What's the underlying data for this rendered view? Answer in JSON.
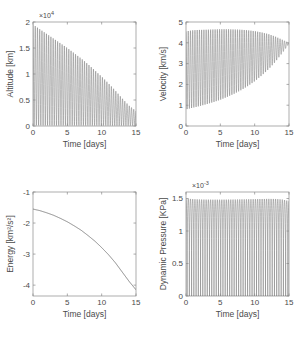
{
  "figure": {
    "background": "#ffffff",
    "axis_color": "#8a8a8a",
    "trace_color": "#6b6b6b",
    "text_color": "#4a4a4a",
    "layout": "2x2 subplot grid"
  },
  "chart_data": [
    {
      "type": "line",
      "name": "altitude-vs-time",
      "title": "",
      "xlabel": "Time [days]",
      "ylabel": "Altitude [km]",
      "y_exponent_label": "×10",
      "y_exponent_value": "4",
      "xlim": [
        0,
        15
      ],
      "ylim": [
        0,
        20000
      ],
      "xticks": [
        0,
        5,
        10,
        15
      ],
      "xticklabels": [
        "0",
        "5",
        "10",
        "15"
      ],
      "yticks": [
        0,
        5000,
        10000,
        15000,
        20000
      ],
      "yticklabels": [
        "0",
        "0.5",
        "1",
        "1.5",
        "2"
      ],
      "grid": false,
      "description": "Rapid periodic oscillations (orbital apoapsis/periapsis) whose upper envelope decays nearly linearly while the lower envelope stays near zero.",
      "oscillation": {
        "cycles": 46,
        "upper_envelope_x": [
          0,
          1,
          2,
          3,
          4,
          5,
          6,
          7,
          8,
          9,
          10,
          11,
          12,
          13,
          14,
          15
        ],
        "upper_envelope_y": [
          19500,
          18600,
          17700,
          16800,
          15900,
          15000,
          14000,
          13000,
          11900,
          10700,
          9500,
          8200,
          6800,
          5300,
          3900,
          2900
        ],
        "lower_envelope_x": [
          0,
          5,
          10,
          15
        ],
        "lower_envelope_y": [
          120,
          110,
          100,
          90
        ]
      }
    },
    {
      "type": "line",
      "name": "velocity-vs-time",
      "title": "",
      "xlabel": "Time [days]",
      "ylabel": "Velocity [km/s]",
      "xlim": [
        0,
        15
      ],
      "ylim": [
        0,
        5
      ],
      "xticks": [
        0,
        5,
        10,
        15
      ],
      "xticklabels": [
        "0",
        "5",
        "10",
        "15"
      ],
      "yticks": [
        0,
        1,
        2,
        3,
        4,
        5
      ],
      "yticklabels": [
        "0",
        "1",
        "2",
        "3",
        "4",
        "5"
      ],
      "grid": false,
      "description": "Periodic velocity oscillations between periapsis maxima near 4.6 km/s and apoapsis minima rising from 0.8 km/s, converging to about 4 km/s at the end.",
      "oscillation": {
        "cycles": 46,
        "upper_envelope_x": [
          0,
          1,
          2,
          3,
          4,
          5,
          6,
          7,
          8,
          9,
          10,
          11,
          12,
          13,
          14,
          15
        ],
        "upper_envelope_y": [
          4.55,
          4.6,
          4.62,
          4.63,
          4.64,
          4.65,
          4.65,
          4.64,
          4.63,
          4.6,
          4.56,
          4.5,
          4.42,
          4.3,
          4.15,
          4.0
        ],
        "lower_envelope_x": [
          0,
          1,
          2,
          3,
          4,
          5,
          6,
          7,
          8,
          9,
          10,
          11,
          12,
          13,
          14,
          15
        ],
        "lower_envelope_y": [
          0.8,
          0.88,
          0.96,
          1.05,
          1.15,
          1.26,
          1.4,
          1.55,
          1.72,
          1.92,
          2.15,
          2.42,
          2.72,
          3.08,
          3.5,
          3.95
        ]
      }
    },
    {
      "type": "line",
      "name": "energy-vs-time",
      "title": "",
      "xlabel": "Time [days]",
      "ylabel": "Energy [km²/s²]",
      "xlim": [
        0,
        15
      ],
      "ylim": [
        -4.35,
        -1
      ],
      "xticks": [
        0,
        5,
        10,
        15
      ],
      "xticklabels": [
        "0",
        "5",
        "10",
        "15"
      ],
      "yticks": [
        -1,
        -2,
        -3,
        -4
      ],
      "yticklabels": [
        "-1",
        "-2",
        "-3",
        "-4"
      ],
      "grid": false,
      "description": "Smooth monotonically decreasing specific orbital energy curve, steepening with time.",
      "x": [
        0,
        1,
        2,
        3,
        4,
        5,
        6,
        7,
        8,
        9,
        10,
        11,
        12,
        13,
        14,
        15
      ],
      "values": [
        -1.55,
        -1.6,
        -1.67,
        -1.75,
        -1.85,
        -1.96,
        -2.09,
        -2.23,
        -2.4,
        -2.58,
        -2.79,
        -3.02,
        -3.28,
        -3.58,
        -3.88,
        -4.15
      ]
    },
    {
      "type": "line",
      "name": "dynamic-pressure-vs-time",
      "title": "",
      "xlabel": "Time [days]",
      "ylabel": "Dynamic Pressure [KPa]",
      "y_exponent_label": "×10",
      "y_exponent_value": "-3",
      "xlim": [
        0,
        15
      ],
      "ylim": [
        0,
        1.6
      ],
      "xticks": [
        0,
        5,
        10,
        15
      ],
      "xticklabels": [
        "0",
        "5",
        "10",
        "15"
      ],
      "yticks": [
        0,
        0.5,
        1,
        1.5
      ],
      "yticklabels": [
        "0",
        "0.5",
        "1",
        "1.5"
      ],
      "grid": false,
      "description": "Sharp periodic dynamic-pressure spikes at each periapsis pass, all reaching about 1.47e-3 to 1.5e-3 KPa, with the envelope dipping slightly at the end.",
      "oscillation": {
        "cycles": 46,
        "upper_envelope_x": [
          0,
          1,
          2,
          3,
          4,
          5,
          6,
          7,
          8,
          9,
          10,
          11,
          12,
          13,
          14,
          15
        ],
        "upper_envelope_y": [
          1.5,
          1.49,
          1.485,
          1.483,
          1.482,
          1.482,
          1.483,
          1.484,
          1.486,
          1.488,
          1.49,
          1.492,
          1.494,
          1.493,
          1.485,
          1.46
        ],
        "lower_envelope_x": [
          0,
          15
        ],
        "lower_envelope_y": [
          0,
          0
        ]
      }
    }
  ]
}
